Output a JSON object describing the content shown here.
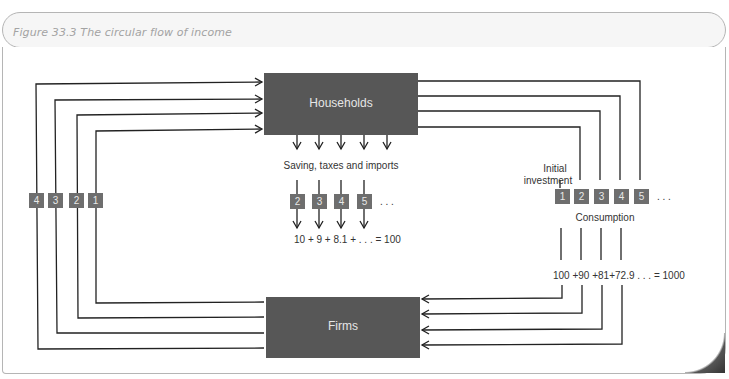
{
  "figure": {
    "title": "Figure 33.3  The circular flow of income"
  },
  "nodes": {
    "households": "Households",
    "firms": "Firms"
  },
  "left_loop_markers": [
    "4",
    "3",
    "2",
    "1"
  ],
  "leakage": {
    "label": "Saving, taxes and imports",
    "markers": [
      "2",
      "3",
      "4",
      "5"
    ],
    "ellipsis": ". . .",
    "sum": "10  +  9  + 8.1 +   . . .  = 100"
  },
  "injection": {
    "label_line1": "Initial",
    "label_line2": "investment",
    "markers": [
      "1",
      "2",
      "3",
      "4",
      "5"
    ],
    "ellipsis": ". . .",
    "consumption_label": "Consumption",
    "sum": "100 +90 +81+72.9  . . .  = 1000"
  },
  "colors": {
    "box": "#575757",
    "marker": "#6e6e6e",
    "line": "#222222"
  }
}
